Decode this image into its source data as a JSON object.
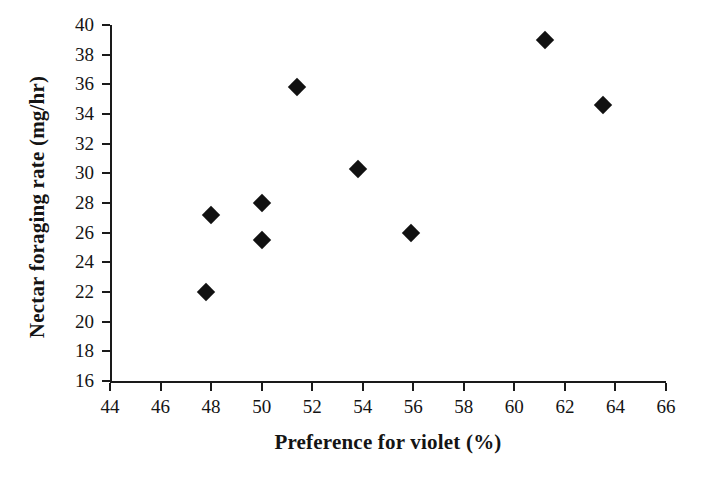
{
  "chart_data": {
    "type": "scatter",
    "title": "",
    "xlabel": "Preference for violet (%)",
    "ylabel": "Nectar foraging rate (mg/hr)",
    "xlim": [
      44,
      66
    ],
    "ylim": [
      16,
      40
    ],
    "xticks": [
      44,
      46,
      48,
      50,
      52,
      54,
      56,
      58,
      60,
      62,
      64,
      66
    ],
    "yticks": [
      16,
      18,
      20,
      22,
      24,
      26,
      28,
      30,
      32,
      34,
      36,
      38,
      40
    ],
    "xtick_labels": [
      "44",
      "46",
      "48",
      "50",
      "52",
      "54",
      "56",
      "58",
      "60",
      "62",
      "64",
      "66"
    ],
    "ytick_labels": [
      "16",
      "18",
      "20",
      "22",
      "24",
      "26",
      "28",
      "30",
      "32",
      "34",
      "36",
      "38",
      "40"
    ],
    "grid": false,
    "legend": false,
    "marker_shape": "diamond",
    "marker_color": "#111111",
    "axis_color": "#1a1a1a",
    "background_color": "#ffffff",
    "series": [
      {
        "name": "Nectar foraging rate vs preference for violet",
        "points": [
          {
            "x": 47.8,
            "y": 22.0
          },
          {
            "x": 48.0,
            "y": 27.2
          },
          {
            "x": 50.0,
            "y": 28.0
          },
          {
            "x": 50.0,
            "y": 25.5
          },
          {
            "x": 51.4,
            "y": 35.8
          },
          {
            "x": 53.8,
            "y": 30.3
          },
          {
            "x": 55.9,
            "y": 26.0
          },
          {
            "x": 61.2,
            "y": 39.0
          },
          {
            "x": 63.5,
            "y": 34.6
          }
        ]
      }
    ]
  }
}
